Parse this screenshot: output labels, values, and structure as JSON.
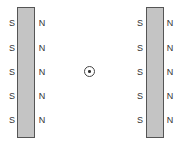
{
  "diagram": {
    "left_magnet": {
      "left_labels": [
        "S",
        "S",
        "S",
        "S",
        "S"
      ],
      "right_labels": [
        "N",
        "N",
        "N",
        "N",
        "N"
      ]
    },
    "right_magnet": {
      "left_labels": [
        "S",
        "S",
        "S",
        "S",
        "S"
      ],
      "right_labels": [
        "N",
        "N",
        "N",
        "N",
        "N"
      ]
    },
    "center_symbol": "out-of-page-current",
    "colors": {
      "magnet_fill": "#c4c4c4",
      "magnet_border": "#555555",
      "text": "#333333"
    }
  }
}
